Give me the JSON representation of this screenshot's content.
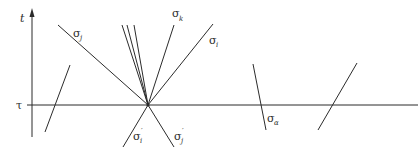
{
  "diagram": {
    "axes": {
      "vertical_label": "t",
      "horizontal_label": "τ"
    },
    "labels": {
      "sigma_j": {
        "base": "σ",
        "sub": "j"
      },
      "sigma_k": {
        "base": "σ",
        "sub": "k"
      },
      "sigma_i": {
        "base": "σ",
        "sub": "i"
      },
      "sigma_i_prime": {
        "base": "σ",
        "sub": "i",
        "prime": "′"
      },
      "sigma_j_prime": {
        "base": "σ",
        "sub": "j",
        "prime": "′"
      },
      "sigma_alpha": {
        "base": "σ",
        "sub": "α"
      }
    },
    "colors": {
      "stroke": "#2b2b2b",
      "background": "#ffffff"
    }
  }
}
